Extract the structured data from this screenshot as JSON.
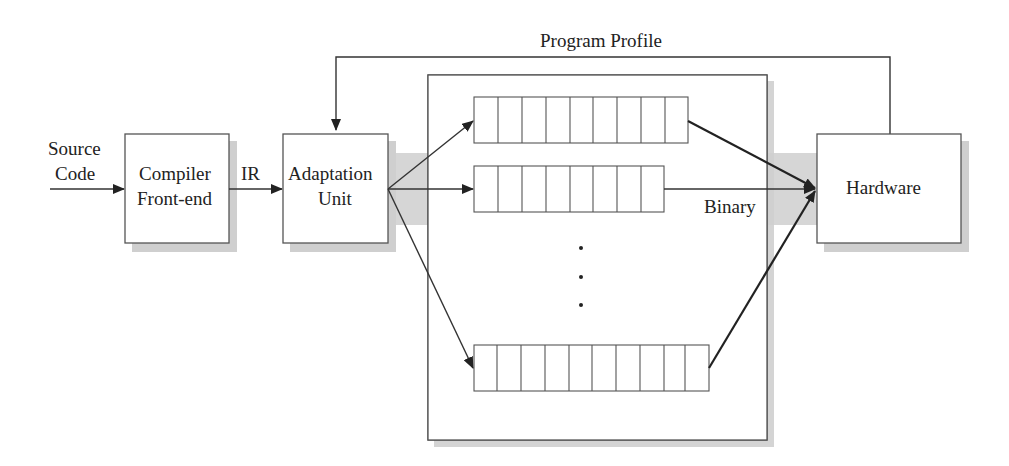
{
  "diagram": {
    "nodes": {
      "source": {
        "label_line1": "Source",
        "label_line2": "Code"
      },
      "frontend": {
        "label_line1": "Compiler",
        "label_line2": "Front-end"
      },
      "adaptation": {
        "label_line1": "Adaptation",
        "label_line2": "Unit"
      },
      "strategies": {
        "label": "Compilation Strategies"
      },
      "hardware": {
        "label": "Hardware"
      }
    },
    "edges": {
      "ir": {
        "label": "IR"
      },
      "binary": {
        "label": "Binary"
      },
      "feedback": {
        "label": "Program Profile"
      }
    },
    "rows": [
      {
        "cells": 9
      },
      {
        "cells": 8
      },
      {
        "cells": 10
      }
    ],
    "ellipsis": "⋮",
    "colors": {
      "band": "#d6d6d6",
      "shadow": "#cfcfcf",
      "stroke": "#555555"
    }
  }
}
